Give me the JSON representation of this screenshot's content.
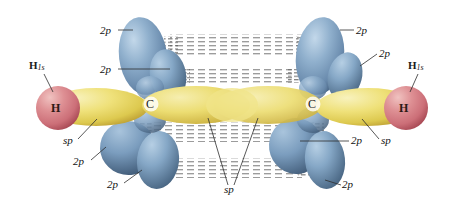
{
  "figure": {
    "width": 461,
    "height": 204,
    "background": "#ffffff"
  },
  "colors": {
    "p_orbital_blue_light": "#9fbdd8",
    "p_orbital_blue_mid": "#7fa3c4",
    "p_orbital_blue_dark": "#546f8f",
    "sp_orbital_yellow_light": "#f2e89a",
    "sp_orbital_yellow_mid": "#e8d65c",
    "sp_orbital_yellow_dark": "#c9ac3c",
    "hydrogen_pink_light": "#e8a8a8",
    "hydrogen_pink_mid": "#d4767c",
    "hydrogen_pink_dark": "#b8545c",
    "label_text": "#111111",
    "leader_line": "#333333",
    "dashed_overlap": "#6a6a6a"
  },
  "atoms": [
    {
      "id": "h-left",
      "label": "H",
      "x": 58,
      "y": 108,
      "element": "hydrogen"
    },
    {
      "id": "c-left",
      "label": "C",
      "x": 151,
      "y": 104,
      "element": "carbon"
    },
    {
      "id": "c-right",
      "label": "C",
      "x": 313,
      "y": 104,
      "element": "carbon"
    },
    {
      "id": "h-right",
      "label": "H",
      "x": 406,
      "y": 108,
      "element": "hydrogen"
    }
  ],
  "orbital_labels": {
    "h1s_left": {
      "text": "H",
      "sub": "1s",
      "x": 29,
      "y": 66
    },
    "h1s_right": {
      "text": "H",
      "sub": "1s",
      "x": 408,
      "y": 66
    },
    "p_top_left_outer": {
      "text": "2p",
      "x": 100,
      "y": 32
    },
    "p_top_left_inner": {
      "text": "2p",
      "x": 100,
      "y": 70
    },
    "p_top_right_outer": {
      "text": "2p",
      "x": 356,
      "y": 31
    },
    "p_top_right_inner": {
      "text": "2p",
      "x": 379,
      "y": 54
    },
    "p_bottom_left_upper": {
      "text": "2p",
      "x": 73,
      "y": 163
    },
    "p_bottom_left_lower": {
      "text": "2p",
      "x": 107,
      "y": 186
    },
    "p_bottom_right_upper": {
      "text": "2p",
      "x": 351,
      "y": 142
    },
    "p_bottom_right_lower": {
      "text": "2p",
      "x": 342,
      "y": 186
    },
    "sp_left": {
      "text": "sp",
      "x": 63,
      "y": 141
    },
    "sp_right": {
      "text": "sp",
      "x": 381,
      "y": 141
    },
    "sp_center": {
      "text": "sp",
      "x": 224,
      "y": 190
    }
  },
  "structure_notes": {
    "sigma_bonds": [
      "H-C left",
      "C-C center",
      "C-H right"
    ],
    "pi_bonds": 2,
    "hybridization": "sp",
    "unhybridized_p_per_carbon": 2
  }
}
